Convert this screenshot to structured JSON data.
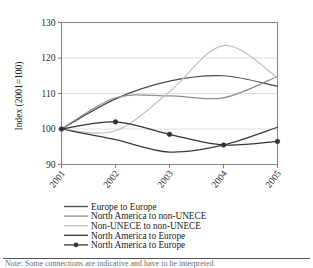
{
  "figure": {
    "background_color": "#ffffff",
    "plot_border_color": "#8a8a8a",
    "gridline_color": "#d9d9d9"
  },
  "axes": {
    "ylabel": "Index (2001=100)",
    "y_ticks": [
      "90",
      "100",
      "110",
      "120",
      "130"
    ],
    "x_ticks": [
      "2001",
      "2002",
      "2003",
      "2004",
      "2005"
    ]
  },
  "legend": {
    "items": [
      {
        "label": "Europe to Europe",
        "color": "#4a4a4a",
        "marker": "none"
      },
      {
        "label": "North America to non-UNECE",
        "color": "#8d8d8d",
        "marker": "none"
      },
      {
        "label": "Non-UNECE to non-UNECE",
        "color": "#c2c2c2",
        "marker": "none"
      },
      {
        "label": "North America to Europe",
        "color": "#3a3a3a",
        "marker": "none"
      },
      {
        "label": "North America to Europe",
        "color": "#333333",
        "marker": "circle"
      }
    ]
  },
  "caption": {
    "text": "Note: Some connections are indicative and have to be interpreted"
  },
  "chart_data": {
    "type": "line",
    "title": "",
    "xlabel": "",
    "ylabel": "Index (2001=100)",
    "x": [
      "2001",
      "2002",
      "2003",
      "2004",
      "2005"
    ],
    "xlim": [
      2001,
      2005
    ],
    "ylim": [
      90,
      130
    ],
    "grid": true,
    "legend_position": "bottom",
    "series": [
      {
        "name": "Europe to Europe",
        "color": "#4a4a4a",
        "marker": "none",
        "values": [
          100,
          108.5,
          113.5,
          115,
          112
        ]
      },
      {
        "name": "North America to non-UNECE",
        "color": "#8d8d8d",
        "marker": "none",
        "values": [
          100,
          108.8,
          109.3,
          108.8,
          114.8
        ]
      },
      {
        "name": "Non-UNECE to non-UNECE",
        "color": "#c2c2c2",
        "marker": "none",
        "values": [
          100,
          99.5,
          110.5,
          123.5,
          114.5
        ]
      },
      {
        "name": "North America to Europe",
        "color": "#3a3a3a",
        "marker": "none",
        "values": [
          100,
          97,
          93.5,
          95.5,
          100.5
        ]
      },
      {
        "name": "North America to Europe",
        "color": "#333333",
        "marker": "circle",
        "values": [
          100,
          102,
          98.5,
          95.5,
          96.5
        ]
      }
    ]
  }
}
